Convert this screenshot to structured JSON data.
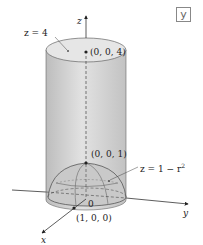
{
  "badge": {
    "label": "y"
  },
  "labels": {
    "z_axis": "z",
    "x_axis": "x",
    "y_axis": "y",
    "origin": "0",
    "plane_eq": "z = 4",
    "point_top": "(0, 0, 4)",
    "point_apex": "(0, 0, 1)",
    "point_x": "(1, 0, 0)",
    "paraboloid_eq": "z = 1 − r",
    "paraboloid_exp": "2"
  },
  "colors": {
    "cylinder_fill": "#d2d2d2",
    "cylinder_top": "#e4e4e4",
    "paraboloid_fill": "#c4c4c4",
    "stroke": "#555555",
    "axis": "#333333"
  }
}
